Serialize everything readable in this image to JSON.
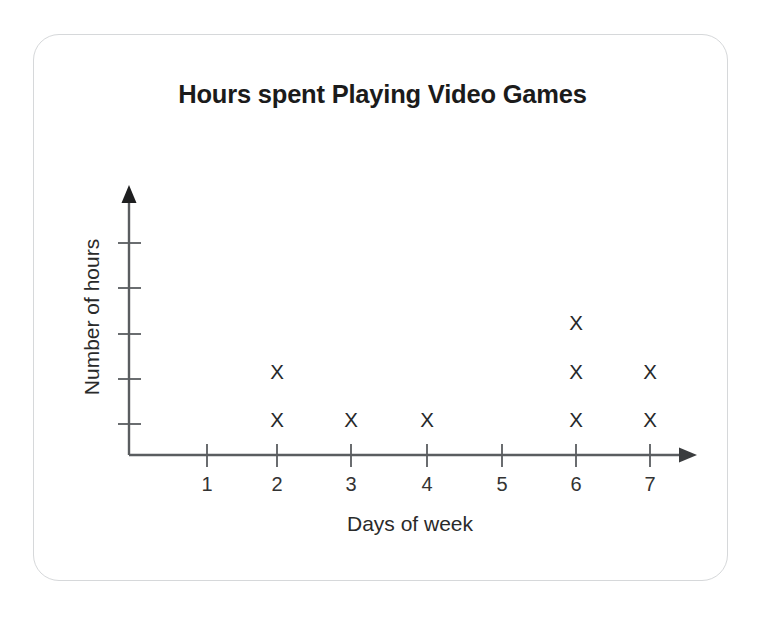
{
  "chart_data": {
    "type": "scatter",
    "plot_style": "dot-plot",
    "title": "Hours spent Playing Video Games",
    "xlabel": "Days of week",
    "ylabel": "Number of hours",
    "categories": [
      "1",
      "2",
      "3",
      "4",
      "5",
      "6",
      "7"
    ],
    "values": [
      0,
      2,
      1,
      1,
      0,
      3,
      2
    ],
    "marker": "X",
    "marker_color": "#27292b",
    "grid": false,
    "legend": null,
    "xlim": [
      0,
      7
    ],
    "ylim": [
      0,
      5
    ],
    "x_tick_labels": [
      "1",
      "2",
      "3",
      "4",
      "5",
      "6",
      "7"
    ],
    "y_tick_labels": [
      "",
      "",
      "",
      "",
      ""
    ],
    "y_tick_count": 5,
    "axis_arrows": true,
    "axis_color": "#5a5d60",
    "points": [
      {
        "x": "2",
        "stack": 1
      },
      {
        "x": "2",
        "stack": 2
      },
      {
        "x": "3",
        "stack": 1
      },
      {
        "x": "4",
        "stack": 1
      },
      {
        "x": "6",
        "stack": 1
      },
      {
        "x": "6",
        "stack": 2
      },
      {
        "x": "6",
        "stack": 3
      },
      {
        "x": "7",
        "stack": 1
      },
      {
        "x": "7",
        "stack": 2
      }
    ]
  },
  "card": {
    "border_color": "#d6d8da",
    "background": "#ffffff"
  }
}
